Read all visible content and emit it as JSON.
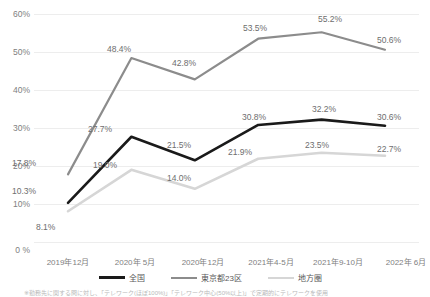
{
  "chart_data": {
    "type": "line",
    "title": "",
    "xlabel": "",
    "ylabel": "",
    "ylim": [
      0,
      60
    ],
    "ytick_labels": [
      "60%",
      "50%",
      "40%",
      "30%",
      "20%",
      "10%",
      "0 %"
    ],
    "ytick_values": [
      60,
      50,
      40,
      30,
      20,
      10,
      0
    ],
    "grid": true,
    "legend_position": "bottom",
    "categories": [
      "2019年12月",
      "2020年 5月",
      "2020年12月",
      "2021年4-5月",
      "2021年9-10月",
      "2022年 6月"
    ],
    "series": [
      {
        "name": "全国",
        "color": "#1a1a1a",
        "values": [
          10.3,
          27.7,
          21.5,
          30.8,
          32.2,
          30.6
        ],
        "labels": [
          "10.3%",
          "27.7%",
          "21.5%",
          "30.8%",
          "32.2%",
          "30.6%"
        ]
      },
      {
        "name": "東京都23区",
        "color": "#8c8c8c",
        "values": [
          17.8,
          48.4,
          42.8,
          53.5,
          55.2,
          50.6
        ],
        "labels": [
          "17.8%",
          "48.4%",
          "42.8%",
          "53.5%",
          "55.2%",
          "50.6%"
        ]
      },
      {
        "name": "地方圏",
        "color": "#d6d6d6",
        "values": [
          8.1,
          19.0,
          14.0,
          21.9,
          23.5,
          22.7
        ],
        "labels": [
          "8.1%",
          "19.0%",
          "14.0%",
          "21.9%",
          "23.5%",
          "22.7%"
        ]
      }
    ]
  },
  "legend": {
    "items": [
      {
        "label": "全国",
        "color": "#1a1a1a"
      },
      {
        "label": "東京都23区",
        "color": "#8c8c8c"
      },
      {
        "label": "地方圏",
        "color": "#d6d6d6"
      }
    ]
  },
  "footnote": {
    "text": "※勤務先に関する問に対し、「テレワーク(ほぼ100%)」「テレワーク中心(50%以上)」で定期的にテレワークを使用"
  }
}
